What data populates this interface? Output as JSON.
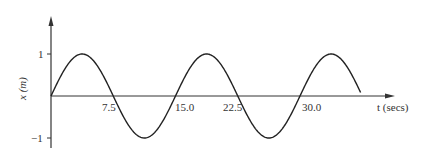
{
  "chart_data": {
    "type": "line",
    "title": "",
    "xlabel": "t (secs)",
    "ylabel": "x (m)",
    "xlim": [
      0,
      45
    ],
    "ylim": [
      -1,
      1
    ],
    "grid": false,
    "legend": null,
    "x_ticks": [
      "7.5",
      "15.0",
      "22.5",
      "30.0"
    ],
    "y_ticks": [
      "1",
      "-1"
    ],
    "series": [
      {
        "name": "x(t) = sin(2πt/15)",
        "function": "sine",
        "amplitude": 1,
        "period": 15,
        "x": [
          0,
          3.75,
          7.5,
          11.25,
          15,
          18.75,
          22.5,
          26.25,
          30,
          33.75,
          37.5
        ],
        "values": [
          0,
          1,
          0,
          -1,
          0,
          1,
          0,
          -1,
          0,
          1,
          0
        ]
      }
    ]
  },
  "labels": {
    "xlabel": "t (secs)",
    "ylabel": "x (m)",
    "tick_75": "7.5",
    "tick_15": "15.0",
    "tick_225": "22.5",
    "tick_30": "30.0",
    "ytick_pos": "1",
    "ytick_neg": "−1"
  }
}
